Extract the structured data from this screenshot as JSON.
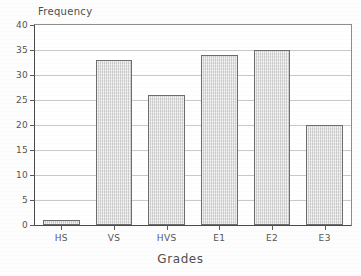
{
  "chart_data": {
    "type": "bar",
    "title": "",
    "xlabel": "Grades",
    "ylabel": "Frequency",
    "categories": [
      "HS",
      "VS",
      "HVS",
      "E1",
      "E2",
      "E3"
    ],
    "values": [
      1,
      33,
      26,
      34,
      35,
      20
    ],
    "ylim": [
      0,
      40
    ],
    "ytick_values": [
      0,
      5,
      10,
      15,
      20,
      25,
      30,
      35,
      40
    ],
    "ytick_labels": [
      "0",
      "5",
      "10",
      "15",
      "20",
      "25",
      "30",
      "35",
      "40"
    ],
    "grid": true,
    "legend": false,
    "bar_color": "#dcdcdc",
    "bar_border_color": "#6d6d6d",
    "grid_color": "#c9c9c9",
    "axis_color": "#4a4a4a"
  }
}
